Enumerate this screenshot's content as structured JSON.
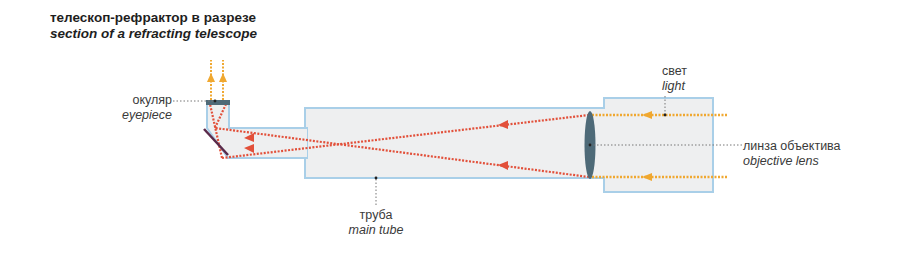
{
  "title": {
    "ru": "телескоп-рефрактор в разрезе",
    "en": "section of a refracting telescope"
  },
  "labels": {
    "eyepiece": {
      "ru": "окуляр",
      "en": "eyepiece"
    },
    "main_tube": {
      "ru": "труба",
      "en": "main tube"
    },
    "light": {
      "ru": "свет",
      "en": "light"
    },
    "objective_lens": {
      "ru": "линза объектива",
      "en": "objective lens"
    }
  },
  "colors": {
    "tube_fill": "#eeeff0",
    "tube_outline": "#a9cfe8",
    "light_ray": "#f0a830",
    "focused_ray": "#e2503a",
    "lens": "#4e6a78",
    "mirror": "#5a2a4a",
    "leader_line": "#666666"
  }
}
